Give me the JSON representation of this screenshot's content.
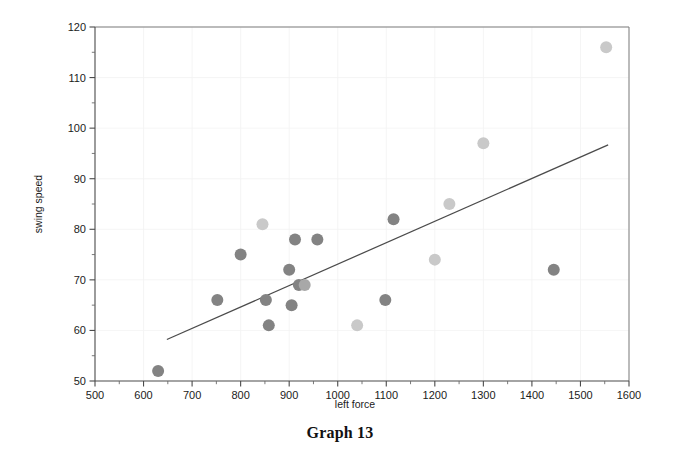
{
  "caption": "Graph 13",
  "chart_data": {
    "type": "scatter",
    "title": "",
    "subtitle": "",
    "xlabel": "left force",
    "ylabel": "swing speed",
    "xlim": [
      500,
      1600
    ],
    "ylim": [
      50,
      120
    ],
    "x_ticks": [
      500,
      600,
      700,
      800,
      900,
      1000,
      1100,
      1200,
      1300,
      1400,
      1500,
      1600
    ],
    "y_ticks": [
      50,
      60,
      70,
      80,
      90,
      100,
      110,
      120
    ],
    "x_minor_step": 50,
    "y_minor_step": 5,
    "grid": true,
    "legend": null,
    "legend_position": "none",
    "marker_colors": {
      "dark": "#838383",
      "light": "#c9c9c9",
      "mid": "#a8a8a8"
    },
    "point_radius": 6,
    "series": [
      {
        "name": "observations",
        "points": [
          {
            "x": 630,
            "y": 52,
            "shade": "dark"
          },
          {
            "x": 752,
            "y": 66,
            "shade": "dark"
          },
          {
            "x": 800,
            "y": 75,
            "shade": "dark"
          },
          {
            "x": 845,
            "y": 81,
            "shade": "light"
          },
          {
            "x": 852,
            "y": 66,
            "shade": "dark"
          },
          {
            "x": 858,
            "y": 61,
            "shade": "dark"
          },
          {
            "x": 900,
            "y": 72,
            "shade": "dark"
          },
          {
            "x": 905,
            "y": 65,
            "shade": "dark"
          },
          {
            "x": 912,
            "y": 78,
            "shade": "dark"
          },
          {
            "x": 920,
            "y": 69,
            "shade": "dark"
          },
          {
            "x": 932,
            "y": 69,
            "shade": "mid"
          },
          {
            "x": 958,
            "y": 78,
            "shade": "dark"
          },
          {
            "x": 1040,
            "y": 61,
            "shade": "light"
          },
          {
            "x": 1098,
            "y": 66,
            "shade": "dark"
          },
          {
            "x": 1115,
            "y": 82,
            "shade": "dark"
          },
          {
            "x": 1200,
            "y": 74,
            "shade": "light"
          },
          {
            "x": 1230,
            "y": 85,
            "shade": "light"
          },
          {
            "x": 1300,
            "y": 97,
            "shade": "light"
          },
          {
            "x": 1445,
            "y": 72,
            "shade": "dark"
          },
          {
            "x": 1553,
            "y": 116,
            "shade": "light"
          }
        ]
      }
    ],
    "trend_line": {
      "name": "fit line",
      "x_start": 648,
      "y_start": 58.2,
      "x_end": 1557,
      "y_end": 96.7,
      "color": "#4b4b4b"
    }
  }
}
